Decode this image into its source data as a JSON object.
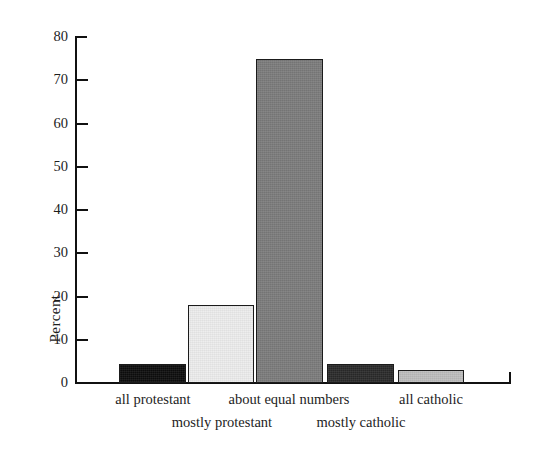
{
  "chart_data": {
    "type": "bar",
    "title": "",
    "subtitle": "",
    "xlabel": "",
    "ylabel": "Percent",
    "ylim": [
      0,
      80
    ],
    "yticks": [
      0,
      10,
      20,
      30,
      40,
      50,
      60,
      70,
      80
    ],
    "grid": false,
    "legend": "none",
    "categories": [
      "all protestant",
      "mostly protestant",
      "about equal numbers",
      "mostly catholic",
      "all catholic"
    ],
    "values": [
      4.5,
      18,
      75,
      4.5,
      3
    ],
    "bar_fills": [
      "#0d0d0d",
      "#ededed",
      "#7b7b7b",
      "#2a2a2a",
      "#bdbdbd"
    ],
    "bar_edge_color": "#1b1b1b",
    "annotations": []
  },
  "axis": {
    "y_label": "Percent",
    "y_tick_labels": [
      "0",
      "10",
      "20",
      "30",
      "40",
      "50",
      "60",
      "70",
      "80"
    ],
    "x_tick_labels_row1": [
      "all protestant",
      "about equal numbers",
      "all catholic"
    ],
    "x_tick_labels_row2": [
      "mostly protestant",
      "mostly catholic"
    ]
  }
}
